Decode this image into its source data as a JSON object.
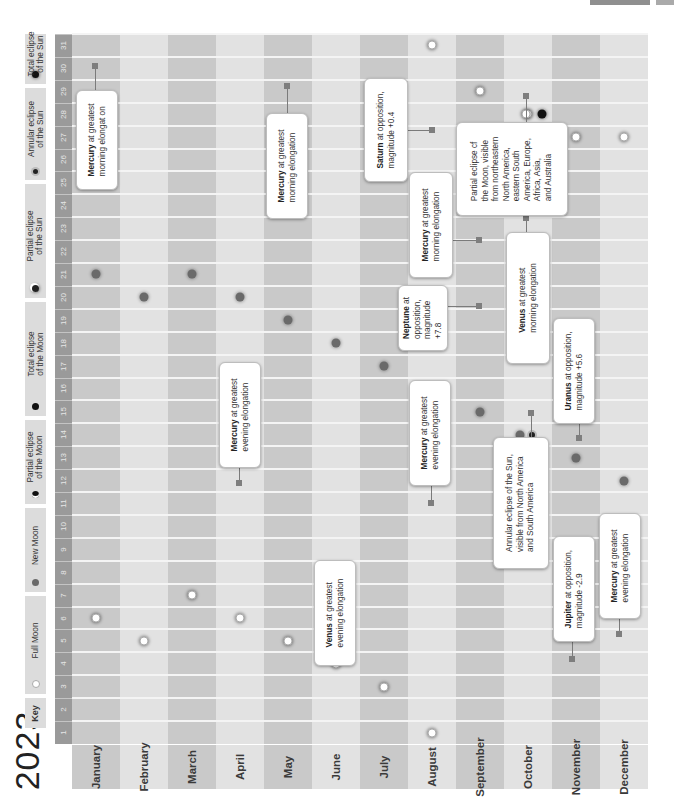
{
  "title": "2023",
  "key": {
    "heading": "Key",
    "items": [
      {
        "label": "Full Moon",
        "icon": "full-moon-icon"
      },
      {
        "label": "New Moon",
        "icon": "new-moon-icon"
      },
      {
        "label": "Partial eclipse of the Moon",
        "icon": "partial-lunar-eclipse-icon"
      },
      {
        "label": "Total eclipse of the Moon",
        "icon": "total-lunar-eclipse-icon"
      },
      {
        "label": "Partial eclipse of the Sun",
        "icon": "partial-solar-eclipse-icon"
      },
      {
        "label": "Annular eclipse of the Sun",
        "icon": "annular-solar-eclipse-icon"
      },
      {
        "label": "Total eclipse of the Sun",
        "icon": "total-solar-eclipse-icon"
      }
    ]
  },
  "colors": {
    "day_strip": "#9a9a9a",
    "month_dark": "#c9c9c9",
    "month_light": "#e2e2e2",
    "callout_bg": "#ffffff",
    "pin": "#7e7e7e"
  },
  "chart_data": {
    "type": "table",
    "title": "2023",
    "orientation": "rotated 90deg; months along bottom, days 1-31 along left edge",
    "months": [
      "January",
      "February",
      "March",
      "April",
      "May",
      "June",
      "July",
      "August",
      "September",
      "October",
      "November",
      "December"
    ],
    "days": [
      1,
      2,
      3,
      4,
      5,
      6,
      7,
      8,
      9,
      10,
      11,
      12,
      13,
      14,
      15,
      16,
      17,
      18,
      19,
      20,
      21,
      22,
      23,
      24,
      25,
      26,
      27,
      28,
      29,
      30,
      31
    ],
    "full_moons": [
      {
        "month": "January",
        "day": 6
      },
      {
        "month": "February",
        "day": 5
      },
      {
        "month": "March",
        "day": 7
      },
      {
        "month": "April",
        "day": 6
      },
      {
        "month": "May",
        "day": 5
      },
      {
        "month": "June",
        "day": 4
      },
      {
        "month": "July",
        "day": 3
      },
      {
        "month": "August",
        "day": 1
      },
      {
        "month": "August",
        "day": 31
      },
      {
        "month": "September",
        "day": 29
      },
      {
        "month": "October",
        "day": 28
      },
      {
        "month": "November",
        "day": 27
      },
      {
        "month": "December",
        "day": 27
      }
    ],
    "new_moons": [
      {
        "month": "January",
        "day": 21
      },
      {
        "month": "February",
        "day": 20
      },
      {
        "month": "March",
        "day": 21
      },
      {
        "month": "April",
        "day": 20
      },
      {
        "month": "May",
        "day": 19
      },
      {
        "month": "June",
        "day": 18
      },
      {
        "month": "July",
        "day": 17
      },
      {
        "month": "August",
        "day": 16
      },
      {
        "month": "September",
        "day": 15
      },
      {
        "month": "October",
        "day": 14
      },
      {
        "month": "November",
        "day": 13
      },
      {
        "month": "December",
        "day": 12
      }
    ],
    "eclipses": [
      {
        "month": "October",
        "day": 14,
        "type": "Annular eclipse of the Sun"
      },
      {
        "month": "October",
        "day": 28,
        "type": "Partial eclipse of the Moon"
      }
    ],
    "events": [
      {
        "month": "January",
        "day": 30,
        "bold": "Mercury",
        "text": " at greatest",
        "line2": "morning elongat on"
      },
      {
        "month": "April",
        "day": 11,
        "bold": "Mercury",
        "text": " at greatest",
        "line2": "evening elongation"
      },
      {
        "month": "May",
        "day": 29,
        "bold": "Mercury",
        "text": " at greatest",
        "line2": "morning elongation"
      },
      {
        "month": "June",
        "day": 4,
        "bold": "Venus",
        "text": " at greatest",
        "line2": "evening elongation"
      },
      {
        "month": "August",
        "day": 10,
        "bold": "Mercury",
        "text": " at greatest",
        "line2": "evening elongation"
      },
      {
        "month": "August",
        "day": 27,
        "bold": "Saturn",
        "text": " at opposition,",
        "line2": "magnitude +0.4"
      },
      {
        "month": "September",
        "day": 19,
        "bold": "Neptune",
        "text": " at",
        "lines": [
          "opposition,",
          "magnitude",
          "+7.8"
        ]
      },
      {
        "month": "September",
        "day": 22,
        "bold": "Mercury",
        "text": " at greatest",
        "line2": "morning elongation"
      },
      {
        "month": "October",
        "day": 14,
        "text": "Annular eclipse of the Sun,",
        "lines": [
          "visible from North America",
          "and South America"
        ]
      },
      {
        "month": "October",
        "day": 24,
        "bold": "Venus",
        "text": " at greatest",
        "line2": "morning elongation"
      },
      {
        "month": "October",
        "day": 28,
        "text": "Partial eclipse cf",
        "lines": [
          "the Moon, visible",
          "from northeastern",
          "North America,",
          "eastern South",
          "America, Europe,",
          "Africa, Asia,",
          "and Australia"
        ]
      },
      {
        "month": "November",
        "day": 3,
        "bold": "Jupiter",
        "text": " at opposition,",
        "line2": "magnitude -2.9"
      },
      {
        "month": "November",
        "day": 13,
        "bold": "Uranus",
        "text": " at opposition,",
        "line2": "magnitude +5.6"
      },
      {
        "month": "December",
        "day": 4,
        "bold": "Mercury",
        "text": " at greatest",
        "line2": "evening elongation"
      }
    ]
  }
}
